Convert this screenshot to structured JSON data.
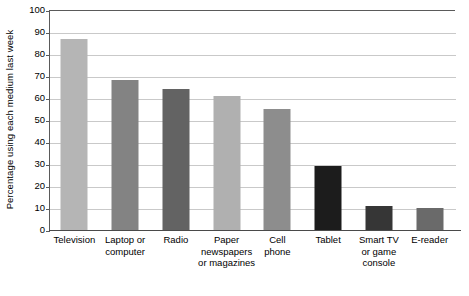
{
  "chart_data": {
    "type": "bar",
    "title": "",
    "xlabel": "",
    "ylabel": "Percentage using each medium last week",
    "ylim": [
      0,
      100
    ],
    "ytick_step": 10,
    "yticks": [
      100,
      90,
      80,
      70,
      60,
      50,
      40,
      30,
      20,
      10,
      0
    ],
    "grid": true,
    "legend": false,
    "orientation": "vertical",
    "categories": [
      "Television",
      "Laptop or computer",
      "Radio",
      "Paper newspapers or magazines",
      "Cell phone",
      "Tablet",
      "Smart TV or game console",
      "E-reader"
    ],
    "category_label_lines": [
      [
        "Television"
      ],
      [
        "Laptop or",
        "computer"
      ],
      [
        "Radio"
      ],
      [
        "Paper",
        "newspapers",
        "or magazines"
      ],
      [
        "Cell",
        "phone"
      ],
      [
        "Tablet"
      ],
      [
        "Smart TV",
        "or game",
        "console"
      ],
      [
        "E-reader"
      ]
    ],
    "values": [
      87,
      68,
      64,
      61,
      55,
      29,
      11,
      10
    ],
    "bar_colors": [
      "#b5b5b5",
      "#838383",
      "#636363",
      "#b0b0b0",
      "#8d8d8d",
      "#1c1c1c",
      "#363636",
      "#6a6a6a"
    ]
  },
  "axis": {
    "grid_color": "#c9c9c9",
    "axis_color": "#5a5a5a"
  }
}
